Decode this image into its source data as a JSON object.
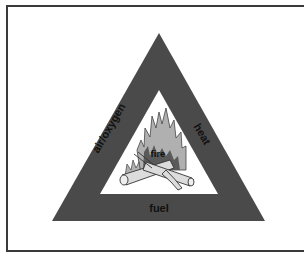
{
  "diagram": {
    "colors": {
      "triangle": "#4a4a4a",
      "inner": "#ffffff",
      "frame": "#3a3a3a",
      "flame": "#a8a8a8",
      "flame_dark": "#5a5a5a",
      "wood": "#d8d8d8",
      "text": "#111111"
    },
    "sides": {
      "left": "air/oxygen",
      "right": "heat",
      "bottom": "fuel"
    },
    "center": "fire",
    "illustration": "campfire-with-logs"
  }
}
